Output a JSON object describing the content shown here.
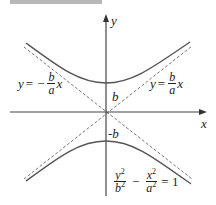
{
  "figure": {
    "type": "hyperbola diagram",
    "axes": {
      "x_label": "x",
      "y_label": "y"
    },
    "vertex_labels": {
      "upper": "b",
      "lower": "-b"
    },
    "asymptotes": {
      "left": {
        "lhs": "y",
        "eq": "=",
        "sign": "−",
        "num": "b",
        "den": "a",
        "var": "x"
      },
      "right": {
        "lhs": "y",
        "eq": "=",
        "num": "b",
        "den": "a",
        "var": "x"
      }
    },
    "equation": {
      "term1_num": "y",
      "term1_num_exp": "2",
      "term1_den": "b",
      "term1_den_exp": "2",
      "minus": "−",
      "term2_num": "x",
      "term2_num_exp": "2",
      "term2_den": "a",
      "term2_den_exp": "2",
      "rhs": "= 1"
    },
    "colors": {
      "curve": "#555555",
      "axis": "#444444",
      "asymptote": "#777777"
    }
  }
}
